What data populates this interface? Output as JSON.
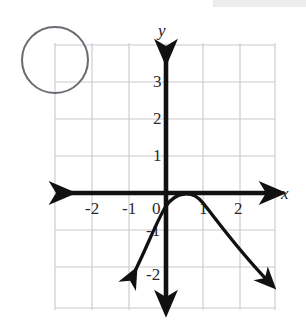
{
  "figure": {
    "background_color": "#ffffff",
    "grid": {
      "visible": true,
      "line_color": "#c9c9cf",
      "cell_size_px": 37,
      "left_px": 53,
      "top_px": 43,
      "right_px": 275,
      "bottom_px": 310,
      "columns": 6,
      "rows": 7
    },
    "axes": {
      "color": "#111111",
      "stroke_width": 4.5,
      "origin_px": {
        "x": 166,
        "y": 193
      },
      "unit_px": 37,
      "x_axis": {
        "label": "x",
        "label_pos_px": {
          "x": 283,
          "y": 198
        },
        "arrows": "both",
        "start_px": 58,
        "end_px": 277
      },
      "y_axis": {
        "label": "y",
        "label_pos_px": {
          "x": 160,
          "y": 34
        },
        "arrows": "both",
        "start_px": 46,
        "end_px": 307
      }
    },
    "tick_labels": {
      "x": [
        {
          "text": "-2",
          "value": -2,
          "x_px": 92,
          "y_px": 212
        },
        {
          "text": "-1",
          "value": -1,
          "x_px": 129,
          "y_px": 212
        },
        {
          "text": "0",
          "value": 0,
          "x_px": 157,
          "y_px": 212
        },
        {
          "text": "1",
          "value": 1,
          "x_px": 201,
          "y_px": 212
        },
        {
          "text": "2",
          "value": 2,
          "x_px": 237,
          "y_px": 212
        }
      ],
      "y": [
        {
          "text": "3",
          "value": 3,
          "x_px": 155,
          "y_px": 85
        },
        {
          "text": "2",
          "value": 2,
          "x_px": 155,
          "y_px": 122
        },
        {
          "text": "1",
          "value": 1,
          "x_px": 155,
          "y_px": 159
        },
        {
          "text": "-1",
          "value": -1,
          "x_px": 150,
          "y_px": 234
        },
        {
          "text": "-2",
          "value": -2,
          "x_px": 150,
          "y_px": 278
        }
      ]
    },
    "curve": {
      "name": "parabola",
      "type": "quadratic",
      "direction": "opens-down",
      "color": "#111111",
      "stroke_width": 3.2,
      "arrows": "both",
      "vertex": {
        "x": 1,
        "y": -0.3
      },
      "y_intercept": {
        "x": 0,
        "y": -1
      },
      "left_arrow_tip_px": {
        "x": 128,
        "y": 283
      },
      "right_arrow_tip_px": {
        "x": 275,
        "y": 287
      },
      "points": [
        {
          "x": -0.65,
          "y": -2.4
        },
        {
          "x": -0.3,
          "y": -1.65
        },
        {
          "x": 0,
          "y": -1.0
        },
        {
          "x": 0.3,
          "y": -0.55
        },
        {
          "x": 0.65,
          "y": -0.32
        },
        {
          "x": 1.0,
          "y": -0.28
        },
        {
          "x": 1.4,
          "y": -0.5
        },
        {
          "x": 1.8,
          "y": -1.05
        },
        {
          "x": 2.2,
          "y": -1.8
        },
        {
          "x": 2.6,
          "y": -2.5
        }
      ]
    },
    "annotation_circle": {
      "name": "blank-circle-marker",
      "center_px": {
        "x": 55,
        "y": 60
      },
      "radius_px": 33,
      "stroke_color": "#6a6a72",
      "stroke_width": 2,
      "fill": "none"
    }
  }
}
